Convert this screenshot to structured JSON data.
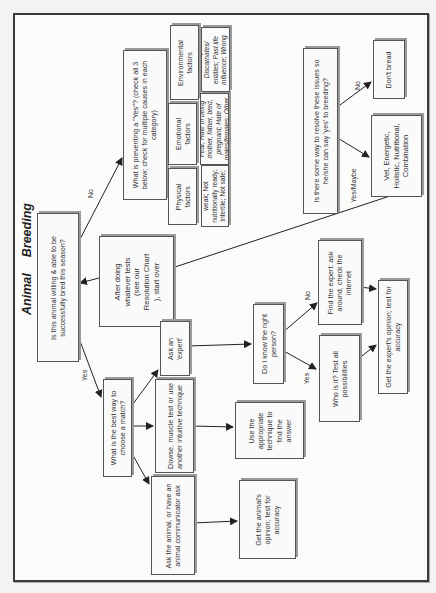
{
  "title": {
    "word1": "Animal",
    "word2": "Breeding"
  },
  "nodes": {
    "q_willing": "Is this animal willing & able to be successfully bred this season?",
    "q_preventing": "What is preventing a \"Yes\"? (check all 3 below; check for multiple causes in each category)",
    "cat_physical": "Physical factors",
    "cat_emotional": "Emotional factors",
    "cat_environmental": "Environmental factors",
    "det_physical": "Too old, sick or weak; Not nutritionally ready; Infertile; Not safe; Other",
    "det_emotional": "Fear; Hate of being mother, father, bred, pregnant; Hate of males/females; Other",
    "det_environmental": "EMF; Geopathic; Discarnates/ entities; Past life influence; Wrong timing; Other",
    "after_tests": "After doing whatever tests (see our Resolution Chart ), start over",
    "q_resolve": "Is there some way to resolve these issues so he/she can say 'yes' to breeding?",
    "dont_breed": "Don't  bread",
    "remedies": "Vet, Energetic, Holistic, Nutritional, Combination",
    "q_best_way": "What is the best way to choose a match?",
    "ask_expert": "Ask an 'expert'",
    "dowse": "Dowse, muscle test or use another intuitive technique",
    "ask_animal": "Ask the animal, or have an animal communicator ask",
    "q_right_person": "Do I know the right person?",
    "use_technique": "Use the appropriate technique to find the answer",
    "animal_opinion": "Get the animal's opinion; test for accuracy",
    "who_is_it": "Who is it? Test all possibilities",
    "find_expert": "Find the expert: ask around, check the internet",
    "expert_opinion": "Get the expert's opinion; test for accuracy"
  },
  "edge_labels": {
    "willing_no": "No",
    "willing_yes": "Yes",
    "resolve_no": "No",
    "resolve_yes": "Yes/Maybe",
    "person_no": "No",
    "person_yes": "Yes"
  },
  "colors": {
    "box_border": "#555555",
    "box_shadow": "#9a9a9a",
    "frame": "#3a3a3a",
    "line": "#222222"
  }
}
